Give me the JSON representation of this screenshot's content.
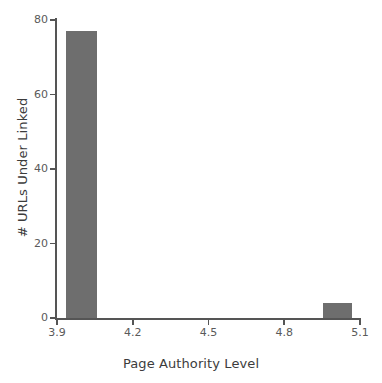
{
  "chart_data": {
    "type": "bar",
    "title": "",
    "subtitle": "",
    "xlabel": "Page Authority Level",
    "ylabel": "# URLs Under Linked",
    "xlim": [
      3.9,
      5.1
    ],
    "ylim": [
      0,
      80
    ],
    "grid": false,
    "legend": null,
    "bar_color": "#6e6e6e",
    "axis_color": "#555555",
    "background": "#ffffff",
    "xticks": [
      {
        "value": 3.9,
        "label": "3.9"
      },
      {
        "value": 4.2,
        "label": "4.2"
      },
      {
        "value": 4.5,
        "label": "4.5"
      },
      {
        "value": 4.8,
        "label": "4.8"
      },
      {
        "value": 5.1,
        "label": "5.1"
      }
    ],
    "yticks": [
      {
        "value": 0,
        "label": "0"
      },
      {
        "value": 20,
        "label": "20"
      },
      {
        "value": 40,
        "label": "40"
      },
      {
        "value": 60,
        "label": "60"
      },
      {
        "value": 80,
        "label": "80"
      }
    ],
    "bars": [
      {
        "x_start": 3.935,
        "x_end": 4.06,
        "x_center": 3.9975,
        "value": 77,
        "label": ""
      },
      {
        "x_start": 4.955,
        "x_end": 5.07,
        "x_center": 5.0125,
        "value": 4,
        "label": ""
      }
    ],
    "categories": [
      "3.9975",
      "5.0125"
    ],
    "values": [
      77,
      4
    ]
  }
}
